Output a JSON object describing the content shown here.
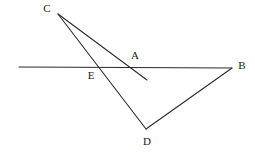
{
  "figure": {
    "width": 255,
    "height": 154,
    "background_color": "#ffffff",
    "stroke_color": "#2b2b2b",
    "label_color": "#1a1a1a",
    "stroke_width": 1.1
  },
  "points": [
    {
      "id": "C",
      "label": "C",
      "x": 58,
      "y": 13,
      "label_x": 47,
      "label_y": 9
    },
    {
      "id": "A",
      "label": "A",
      "x": 131,
      "y": 67,
      "label_x": 135,
      "label_y": 56
    },
    {
      "id": "B",
      "label": "B",
      "x": 232,
      "y": 68,
      "label_x": 242,
      "label_y": 66
    },
    {
      "id": "E",
      "label": "E",
      "x": 96,
      "y": 68,
      "label_x": 91,
      "label_y": 76
    },
    {
      "id": "D",
      "label": "D",
      "x": 146,
      "y": 129,
      "label_x": 147,
      "label_y": 142
    }
  ],
  "segments": [
    {
      "id": "transversal",
      "name": "horizontal-transversal-line",
      "x1": 19,
      "y1": 67,
      "x2": 232,
      "y2": 68
    },
    {
      "id": "c-to-a-ray",
      "name": "segment-c-through-a",
      "x1": 58,
      "y1": 14,
      "x2": 147,
      "y2": 80
    },
    {
      "id": "c-to-d",
      "name": "segment-c-through-e-to-d",
      "x1": 58,
      "y1": 14,
      "x2": 146,
      "y2": 129
    },
    {
      "id": "d-to-b",
      "name": "segment-d-to-b",
      "x1": 146,
      "y1": 129,
      "x2": 232,
      "y2": 68
    }
  ]
}
